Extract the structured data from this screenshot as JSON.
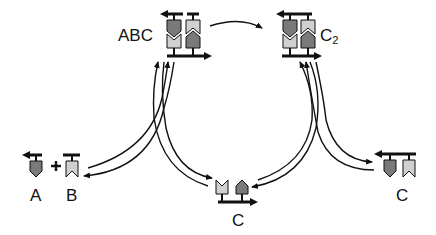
{
  "diagram": {
    "type": "reaction-cycle",
    "colors": {
      "dark_subunit": "#7a7a7a",
      "light_subunit": "#d0d0d0",
      "stroke": "#111111",
      "background": "#ffffff"
    },
    "nodes": {
      "abc": {
        "label": "ABC",
        "description": "heterodimer complex"
      },
      "c2": {
        "label": "C",
        "subscript": "2",
        "description": "homodimer complex"
      },
      "a": {
        "label": "A"
      },
      "b": {
        "label": "B"
      },
      "plus": {
        "label": "+"
      },
      "c_center": {
        "label": "C"
      },
      "c_right": {
        "label": "C"
      }
    },
    "edges": [
      {
        "from": "ABC",
        "to": "C2",
        "style": "single-arrow"
      },
      {
        "from": "A + B",
        "to": "ABC",
        "style": "reversible"
      },
      {
        "from": "ABC",
        "to": "C",
        "style": "reversible"
      },
      {
        "from": "C",
        "to": "C2",
        "style": "reversible"
      },
      {
        "from": "C2",
        "to": "C",
        "style": "reversible"
      }
    ]
  }
}
